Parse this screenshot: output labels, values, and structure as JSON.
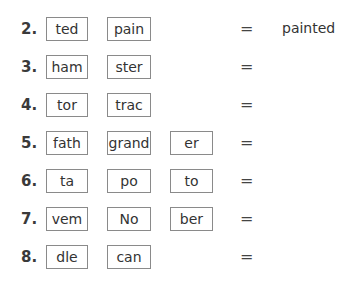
{
  "exercise": {
    "rows": [
      {
        "number": "2.",
        "syllables": [
          "ted",
          "pain"
        ],
        "equals": "=",
        "answer": "painted"
      },
      {
        "number": "3.",
        "syllables": [
          "ham",
          "ster"
        ],
        "equals": "=",
        "answer": ""
      },
      {
        "number": "4.",
        "syllables": [
          "tor",
          "trac"
        ],
        "equals": "=",
        "answer": ""
      },
      {
        "number": "5.",
        "syllables": [
          "fath",
          "grand",
          "er"
        ],
        "equals": "=",
        "answer": ""
      },
      {
        "number": "6.",
        "syllables": [
          "ta",
          "po",
          "to"
        ],
        "equals": "=",
        "answer": ""
      },
      {
        "number": "7.",
        "syllables": [
          "vem",
          "No",
          "ber"
        ],
        "equals": "=",
        "answer": ""
      },
      {
        "number": "8.",
        "syllables": [
          "dle",
          "can"
        ],
        "equals": "=",
        "answer": ""
      }
    ]
  }
}
